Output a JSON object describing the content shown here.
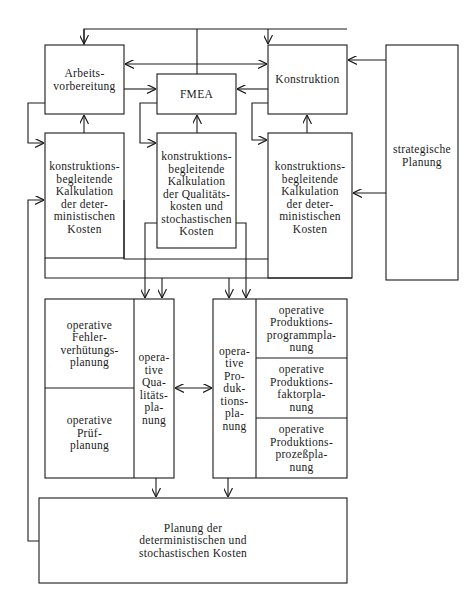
{
  "diagram": {
    "colors": {
      "line": "#1a1a1a",
      "background": "#ffffff"
    },
    "nodes": {
      "arbeitsvorbereitung": "Arbeits-\nvorbereitung",
      "fmea": "FMEA",
      "konstruktion": "Konstruktion",
      "strategische_planung": "strategische\nPlanung",
      "kalk_det_left": "konstruktions-\nbegleitende\nKalkulation\nder deter-\nministischen\nKosten",
      "kalk_qual": "konstruktions-\nbegleitende\nKalkulation\nder Qualitäts-\nkosten und\nstochastischen\nKosten",
      "kalk_det_right": "konstruktions-\nbegleitende\nKalkulation\nder deter-\nministischen\nKosten",
      "op_fehlerverhuetung": "operative\nFehler-\nverhütungs-\nplanung",
      "op_pruefplanung": "operative\nPrüf-\nplanung",
      "op_qualitaetsplanung": "opera-\ntive\nQua-\nlitäts-\npla-\nnung",
      "op_produktionsplanung": "opera-\ntive\nPro-\nduk-\ntions-\npla-\nnung",
      "op_programmplanung": "operative\nProduktions-\nprogrammpla-\nnung",
      "op_faktorplanung": "operative\nProduktions-\nfaktorpla-\nnung",
      "op_prozessplanung": "operative\nProduktions-\nprozeßpla-\nnung",
      "kostenplanung": "Planung der\ndeterministischen und\nstochastischen Kosten"
    }
  }
}
